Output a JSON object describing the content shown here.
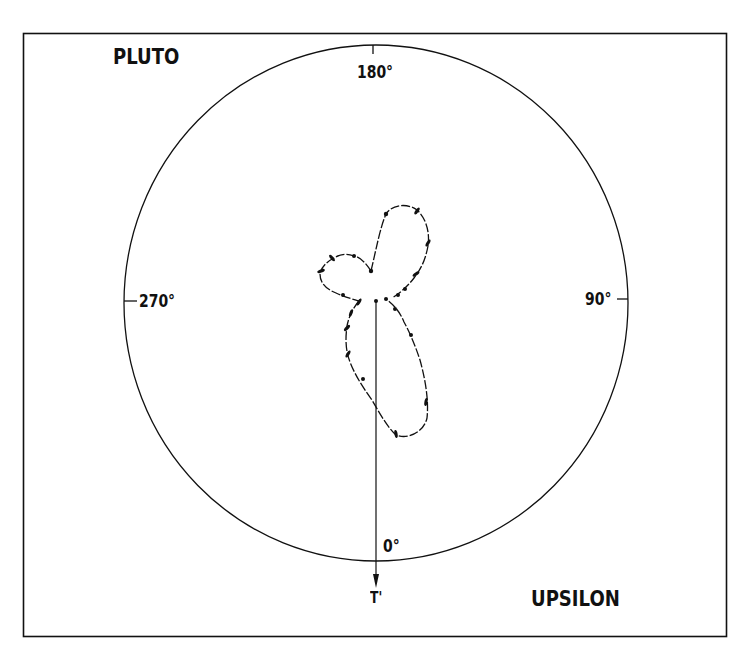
{
  "labels": {
    "top_left": "PLUTO",
    "bottom_right": "UPSILON",
    "angle_top": "180°",
    "angle_right": "90°",
    "angle_bottom": "0°",
    "angle_left": "270°",
    "vector_label": "T'"
  },
  "colors": {
    "background": "#ffffff",
    "ink": "#111111"
  },
  "diagram": {
    "type": "polar-trajectory",
    "frame": {
      "x": 23,
      "y": 33,
      "width": 704,
      "height": 604
    },
    "circle": {
      "cx": 376,
      "cy": 303,
      "rx": 252,
      "ry": 258
    },
    "axis_ticks": [
      "0°",
      "90°",
      "180°",
      "270°"
    ],
    "vector": {
      "from": [
        376,
        301
      ],
      "to": [
        376,
        588
      ],
      "label": "T'"
    },
    "lobes": [
      "upper-right lobe",
      "left lobe",
      "lower elongated lobe"
    ]
  }
}
